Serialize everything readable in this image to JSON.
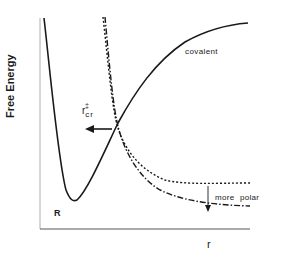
{
  "figure": {
    "y_axis_label": "Free Energy",
    "x_axis_label": "r",
    "curves": [
      {
        "name": "covalent",
        "label": "covalent",
        "style": "solid"
      },
      {
        "name": "ionic-less-polar",
        "label": "",
        "style": "dotted"
      },
      {
        "name": "ionic-more-polar",
        "label": "",
        "style": "dash-dot"
      }
    ],
    "annotations": {
      "reactant_label": "R",
      "critical_r_base": "r",
      "critical_r_sub": "cr",
      "critical_r_sup": "‡",
      "solvent_shift_label": "more polar"
    },
    "colors": {
      "line": "#1a1a1a",
      "background": "#ffffff"
    }
  }
}
